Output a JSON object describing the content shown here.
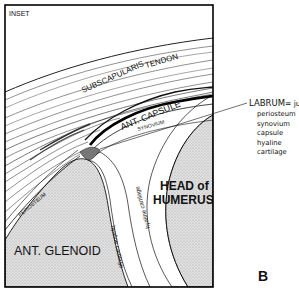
{
  "figure": {
    "inset_label": "INSET",
    "panel_letter": "B",
    "structures": {
      "tendon_left": "SUBSCAPULARIS",
      "tendon_right": "TENDON",
      "capsule": "ANT. CAPSULE",
      "synovium": "SYNOVIUM",
      "periosteum": "PERIOSTEUM",
      "glenoid": "ANT. GLENOID",
      "humerus_line1": "HEAD of",
      "humerus_line2": "HUMERUS",
      "cartilage_glenoid": "hyaline cartilage",
      "cartilage_humerus": "hyaline cartilage"
    },
    "labrum": {
      "title": "LABRUM",
      "definition": "= junction of",
      "components": [
        "periosteum",
        "synovium",
        "capsule",
        "hyaline cartilage"
      ]
    },
    "colors": {
      "ink": "#111111",
      "bone_fill": "#d9d9d9",
      "background": "#ffffff"
    }
  }
}
